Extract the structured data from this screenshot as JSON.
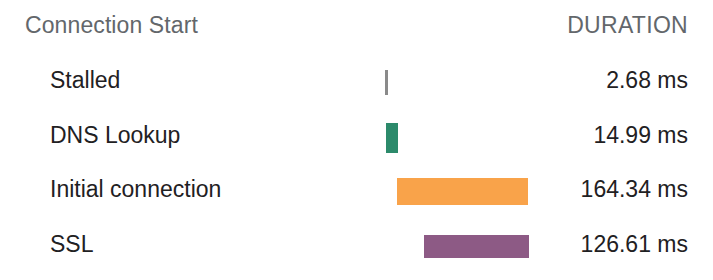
{
  "panel": {
    "title": "Connection Start",
    "duration_header": "DURATION"
  },
  "colors": {
    "stalled": "#8a8a8a",
    "dns": "#2c8a6b",
    "initial_connection": "#f9a34a",
    "ssl": "#8d5a85",
    "label_text": "#1f2123",
    "header_text": "#63676b",
    "background": "#ffffff"
  },
  "rows": [
    {
      "label": "Stalled",
      "duration": "2.68 ms",
      "value_ms": 2.68,
      "color_key": "stalled",
      "bar_left_px": 385,
      "bar_width_px": 3,
      "bar_height_px": 25,
      "row_top_px": 55
    },
    {
      "label": "DNS Lookup",
      "duration": "14.99 ms",
      "value_ms": 14.99,
      "color_key": "dns",
      "bar_left_px": 386,
      "bar_width_px": 12,
      "bar_height_px": 30,
      "row_top_px": 110
    },
    {
      "label": "Initial connection",
      "duration": "164.34 ms",
      "value_ms": 164.34,
      "color_key": "initial_connection",
      "bar_left_px": 397,
      "bar_width_px": 131,
      "bar_height_px": 27,
      "row_top_px": 164
    },
    {
      "label": "SSL",
      "duration": "126.61 ms",
      "value_ms": 126.61,
      "color_key": "ssl",
      "bar_left_px": 424,
      "bar_width_px": 105,
      "bar_height_px": 23,
      "row_top_px": 219
    }
  ],
  "chart_data": {
    "type": "bar",
    "title": "Connection Start",
    "orientation": "horizontal",
    "subtype": "waterfall-timeline",
    "categories": [
      "Stalled",
      "DNS Lookup",
      "Initial connection",
      "SSL"
    ],
    "values": [
      2.68,
      14.99,
      164.34,
      126.61
    ],
    "value_labels": [
      "2.68 ms",
      "14.99 ms",
      "164.34 ms",
      "126.61 ms"
    ],
    "xlabel": "",
    "ylabel": "",
    "unit": "ms",
    "grid": false,
    "legend": "none",
    "columns": [
      "Connection Start",
      "DURATION"
    ],
    "series": [
      {
        "name": "Duration",
        "values": [
          2.68,
          14.99,
          164.34,
          126.61
        ],
        "colors": [
          "#8a8a8a",
          "#2c8a6b",
          "#f9a34a",
          "#8d5a85"
        ]
      }
    ],
    "timeline_start_ms": [
      0,
      0,
      14.99,
      179.33
    ]
  }
}
